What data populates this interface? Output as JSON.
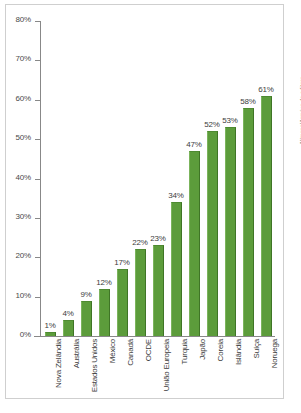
{
  "credit": "Allmaps/Arquivo da editora",
  "chart_data": {
    "type": "bar",
    "title": "",
    "subtitle": "",
    "xlabel": "",
    "ylabel": "",
    "ylim": [
      0,
      80
    ],
    "grid": false,
    "legend": "none",
    "yticks": [
      "0%",
      "10%",
      "20%",
      "30%",
      "40%",
      "50%",
      "60%",
      "70%",
      "80%"
    ],
    "ytick_values": [
      0,
      10,
      20,
      30,
      40,
      50,
      60,
      70,
      80
    ],
    "categories": [
      "Nova Zelândia",
      "Austrália",
      "Estados Unidos",
      "México",
      "Canadá",
      "OCDE",
      "União Europeia",
      "Turquia",
      "Japão",
      "Coreia",
      "Islândia",
      "Suíça",
      "Noruega"
    ],
    "values": [
      1,
      4,
      9,
      12,
      17,
      22,
      23,
      34,
      47,
      52,
      53,
      58,
      61
    ],
    "data_labels": [
      "1%",
      "4%",
      "9%",
      "12%",
      "17%",
      "22%",
      "23%",
      "34%",
      "47%",
      "52%",
      "53%",
      "58%",
      "61%"
    ],
    "bar_color": "#5c9c3b",
    "axis_color": "#888888",
    "text_color": "#3d3d3d",
    "background": "#ffffff"
  }
}
